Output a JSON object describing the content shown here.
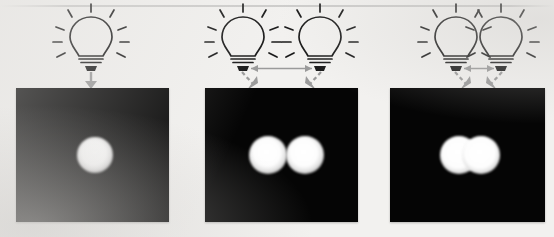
{
  "figure": {
    "background_color": "#f2f1ef",
    "screen_color": "#050505",
    "spot_color": "#ffffff",
    "ink_color": "#1a1a1a",
    "arrow_color": "#9a9a9a",
    "canvas": {
      "width": 554,
      "height": 237
    }
  },
  "panels": [
    {
      "id": "panel-single-source",
      "label": "a",
      "caption": "One light bulb",
      "source_count": 1,
      "bulb_separation_px": 0,
      "separation_arrow": false,
      "beam_arrow_count": 1,
      "spot_shape": "circle",
      "spot_count": 1,
      "spot_overlap": "none",
      "screen": {
        "x": 16,
        "y": 88,
        "width": 153,
        "height": 134
      },
      "bulbs": [
        {
          "cx": 91,
          "cy": 38
        }
      ],
      "spots": [
        {
          "cx": 95,
          "cy": 155,
          "r": 18
        }
      ]
    },
    {
      "id": "panel-two-sources-far",
      "label": "b",
      "caption": "Two light bulbs, wide separation",
      "source_count": 2,
      "bulb_separation_px": 82,
      "separation_arrow": true,
      "beam_arrow_count": 2,
      "spot_shape": "two-overlapping-circles",
      "spot_count": 2,
      "spot_overlap": "partial",
      "screen": {
        "x": 205,
        "y": 88,
        "width": 153,
        "height": 134
      },
      "bulbs": [
        {
          "cx": 243,
          "cy": 38
        },
        {
          "cx": 320,
          "cy": 38
        }
      ],
      "spots": [
        {
          "cx": 268,
          "cy": 155,
          "r": 19
        },
        {
          "cx": 305,
          "cy": 155,
          "r": 19
        }
      ]
    },
    {
      "id": "panel-two-sources-near",
      "label": "c",
      "caption": "Two light bulbs, narrow separation",
      "source_count": 2,
      "bulb_separation_px": 47,
      "separation_arrow": true,
      "beam_arrow_count": 2,
      "spot_shape": "merged-stadium",
      "spot_count": 2,
      "spot_overlap": "merged",
      "screen": {
        "x": 390,
        "y": 88,
        "width": 155,
        "height": 134
      },
      "bulbs": [
        {
          "cx": 456,
          "cy": 38
        },
        {
          "cx": 501,
          "cy": 38
        }
      ],
      "spots": [
        {
          "cx": 459,
          "cy": 155,
          "r": 19
        },
        {
          "cx": 481,
          "cy": 155,
          "r": 19
        }
      ]
    }
  ],
  "icons": {
    "bulb": "light-bulb-icon",
    "beam_arrow": "beam-arrow-icon",
    "separation_arrow": "separation-double-arrow-icon"
  }
}
